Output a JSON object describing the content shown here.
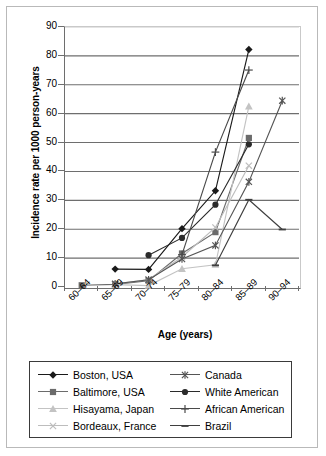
{
  "chart_data": {
    "type": "line",
    "title": "",
    "xlabel": "Age (years)",
    "ylabel": "Incidence rate per 1000 person-years",
    "categories": [
      "60–64",
      "65–69",
      "70–74",
      "75–79",
      "80–84",
      "85–89",
      "90–94"
    ],
    "yticks": [
      0,
      10,
      20,
      30,
      40,
      50,
      60,
      70,
      80,
      90
    ],
    "ylim": [
      0,
      90
    ],
    "grid": "horizontal",
    "legend_position": "bottom",
    "series": [
      {
        "name": "Boston, USA",
        "marker": "diamond",
        "color": "#1a1a1a",
        "values": [
          null,
          6.2,
          6.1,
          20.2,
          33.3,
          82.2,
          null
        ]
      },
      {
        "name": "Baltimore, USA",
        "marker": "square",
        "color": "#6b6b6b",
        "values": [
          0.6,
          0.9,
          2.2,
          11.6,
          19.0,
          51.6,
          null
        ]
      },
      {
        "name": "Hisayama, Japan",
        "marker": "triangle",
        "color": "#c3c3c3",
        "values": [
          null,
          0.8,
          0.5,
          6.3,
          7.7,
          62.5,
          null
        ]
      },
      {
        "name": "Bordeaux, France",
        "marker": "cross-x",
        "color": "#bdbdbd",
        "values": [
          null,
          1.0,
          2.6,
          10.4,
          20.6,
          42.0,
          null
        ]
      },
      {
        "name": "Canada",
        "marker": "asterisk",
        "color": "#555555",
        "values": [
          null,
          1.1,
          2.5,
          9.7,
          14.4,
          36.4,
          64.5
        ]
      },
      {
        "name": "White American",
        "marker": "circle",
        "color": "#2b2b2b",
        "values": [
          null,
          null,
          11.0,
          17.0,
          28.5,
          49.4,
          null
        ]
      },
      {
        "name": "African American",
        "marker": "plus",
        "color": "#4a4a4a",
        "values": [
          null,
          null,
          null,
          11.2,
          46.7,
          75.1,
          null
        ]
      },
      {
        "name": "Brazil",
        "marker": "dash",
        "color": "#3f3f3f",
        "values": [
          null,
          null,
          null,
          null,
          7.5,
          30.2,
          19.9
        ]
      }
    ]
  },
  "legend": {
    "left_column": [
      "Boston, USA",
      "Baltimore, USA",
      "Hisayama, Japan",
      "Bordeaux, France"
    ],
    "right_column": [
      "Canada",
      "White American",
      "African American",
      "Brazil"
    ]
  }
}
